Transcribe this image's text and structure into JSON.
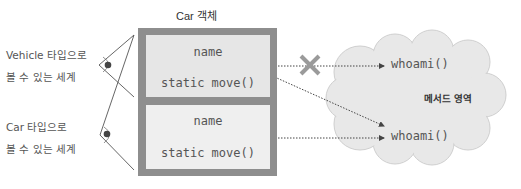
{
  "diagram": {
    "title": "Car 객체",
    "views": [
      {
        "line1": "Vehicle 타입으로",
        "line2": "볼 수 있는 세계"
      },
      {
        "line1": "Car 타입으로",
        "line2": "볼 수 있는 세계"
      }
    ],
    "object_sections": [
      {
        "field": "name",
        "method": "static move()"
      },
      {
        "field": "name",
        "method": "static move()"
      }
    ],
    "method_area": {
      "label": "메서드 영역",
      "methods": [
        "whoami()",
        "whoami()"
      ]
    },
    "blocked_marker": "✕",
    "colors": {
      "outer_box": "#8e8e8e",
      "panel_top": "#e6e6e6",
      "panel_bottom": "#efefef",
      "cloud_fill": "#e8e8e8",
      "cloud_stroke": "#cfcfcf",
      "line": "#444444",
      "x_mark": "#9a9a9a"
    }
  }
}
